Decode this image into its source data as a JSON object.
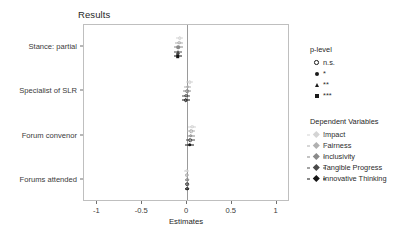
{
  "chart_data": {
    "type": "scatter",
    "title": "Results",
    "xlabel": "Estimates",
    "ylabel": "",
    "xlim": [
      -1.15,
      1.15
    ],
    "xticks": [
      -1,
      -0.5,
      0,
      0.5,
      1
    ],
    "xticklabels": [
      "-1",
      "-0.5",
      "0",
      "0.5",
      "1"
    ],
    "categories": [
      "Stance: partial",
      "Specialist of SLR",
      "Forum convenor",
      "Forums attended"
    ],
    "grid": false,
    "zero_reference_line": 0,
    "legend_position": "right",
    "series": [
      {
        "name": "Impact",
        "color": "#d4d4d4",
        "points": [
          {
            "category": "Stance: partial",
            "estimate": -0.08,
            "ci_low": -0.12,
            "ci_high": -0.04,
            "p_level": "n.s."
          },
          {
            "category": "Specialist of SLR",
            "estimate": 0.03,
            "ci_low": -0.01,
            "ci_high": 0.07,
            "p_level": "n.s."
          },
          {
            "category": "Forum convenor",
            "estimate": 0.055,
            "ci_low": 0.01,
            "ci_high": 0.1,
            "p_level": "n.s."
          },
          {
            "category": "Forums attended",
            "estimate": -0.005,
            "ci_low": -0.03,
            "ci_high": 0.02,
            "p_level": "n.s."
          }
        ]
      },
      {
        "name": "Fairness",
        "color": "#b0b0b0",
        "points": [
          {
            "category": "Stance: partial",
            "estimate": -0.085,
            "ci_low": -0.13,
            "ci_high": -0.04,
            "p_level": "n.s."
          },
          {
            "category": "Specialist of SLR",
            "estimate": 0.01,
            "ci_low": -0.03,
            "ci_high": 0.05,
            "p_level": "n.s."
          },
          {
            "category": "Forum convenor",
            "estimate": 0.045,
            "ci_low": 0.0,
            "ci_high": 0.09,
            "p_level": "n.s."
          },
          {
            "category": "Forums attended",
            "estimate": -0.002,
            "ci_low": -0.027,
            "ci_high": 0.023,
            "p_level": "n.s."
          }
        ]
      },
      {
        "name": "Inclusivity",
        "color": "#8a8a8a",
        "points": [
          {
            "category": "Stance: partial",
            "estimate": -0.095,
            "ci_low": -0.14,
            "ci_high": -0.05,
            "p_level": "*"
          },
          {
            "category": "Specialist of SLR",
            "estimate": 0.0,
            "ci_low": -0.045,
            "ci_high": 0.045,
            "p_level": "n.s."
          },
          {
            "category": "Forum convenor",
            "estimate": 0.04,
            "ci_low": -0.005,
            "ci_high": 0.085,
            "p_level": "n.s."
          },
          {
            "category": "Forums attended",
            "estimate": 0.0,
            "ci_low": -0.025,
            "ci_high": 0.025,
            "p_level": "n.s."
          }
        ]
      },
      {
        "name": "Tangible Progress",
        "color": "#4a4a4a",
        "points": [
          {
            "category": "Stance: partial",
            "estimate": -0.1,
            "ci_low": -0.145,
            "ci_high": -0.055,
            "p_level": "**"
          },
          {
            "category": "Specialist of SLR",
            "estimate": -0.008,
            "ci_low": -0.055,
            "ci_high": 0.039,
            "p_level": "n.s."
          },
          {
            "category": "Forum convenor",
            "estimate": 0.035,
            "ci_low": -0.015,
            "ci_high": 0.085,
            "p_level": "n.s."
          },
          {
            "category": "Forums attended",
            "estimate": 0.002,
            "ci_low": -0.023,
            "ci_high": 0.027,
            "p_level": "n.s."
          }
        ]
      },
      {
        "name": "Innovative Thinking",
        "color": "#151515",
        "points": [
          {
            "category": "Stance: partial",
            "estimate": -0.105,
            "ci_low": -0.15,
            "ci_high": -0.06,
            "p_level": "***"
          },
          {
            "category": "Specialist of SLR",
            "estimate": -0.015,
            "ci_low": -0.06,
            "ci_high": 0.03,
            "p_level": "n.s."
          },
          {
            "category": "Forum convenor",
            "estimate": 0.03,
            "ci_low": -0.02,
            "ci_high": 0.08,
            "p_level": "*"
          },
          {
            "category": "Forums attended",
            "estimate": 0.003,
            "ci_low": -0.022,
            "ci_high": 0.028,
            "p_level": "n.s."
          }
        ]
      }
    ]
  },
  "legends": {
    "plevel": {
      "title": "p-level",
      "items": [
        {
          "label": "n.s.",
          "shape": "circle-open"
        },
        {
          "label": "*",
          "shape": "circle-filled"
        },
        {
          "label": "**",
          "shape": "triangle"
        },
        {
          "label": "***",
          "shape": "square"
        }
      ]
    },
    "dependent_variables": {
      "title": "Dependent Variables",
      "items": [
        {
          "label": "Impact",
          "color": "#d4d4d4"
        },
        {
          "label": "Fairness",
          "color": "#b0b0b0"
        },
        {
          "label": "Inclusivity",
          "color": "#8a8a8a"
        },
        {
          "label": "Tangible Progress",
          "color": "#4a4a4a"
        },
        {
          "label": "Innovative Thinking",
          "color": "#151515"
        }
      ]
    }
  }
}
